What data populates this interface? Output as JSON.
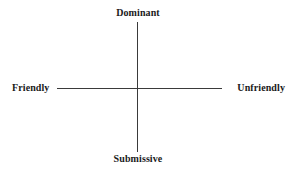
{
  "diagram": {
    "type": "two-axis-circumplex",
    "title": "",
    "background_color": "#ffffff",
    "line_color": "#3a3a3a",
    "text_color": "#1a1a1a",
    "axes": {
      "vertical": {
        "name": "dominance-axis",
        "positive_pole": "Dominant",
        "negative_pole": "Submissive"
      },
      "horizontal": {
        "name": "affiliation-axis",
        "positive_pole": "Friendly",
        "negative_pole": "Unfriendly"
      }
    },
    "labels": {
      "top": "Dominant",
      "bottom": "Submissive",
      "left": "Friendly",
      "right": "Unfriendly"
    }
  }
}
